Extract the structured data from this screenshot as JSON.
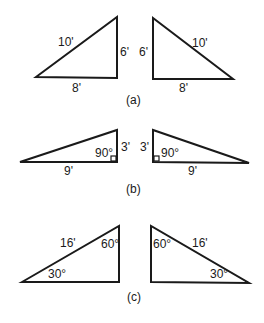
{
  "figure": {
    "panels": [
      {
        "caption": "(a)",
        "left": {
          "hyp": "10'",
          "vert": "6'",
          "base": "8'"
        },
        "right": {
          "hyp": "10'",
          "vert": "6'",
          "base": "8'"
        }
      },
      {
        "caption": "(b)",
        "left": {
          "angle": "90°",
          "vert": "3'",
          "base": "9'"
        },
        "right": {
          "angle": "90°",
          "vert": "3'",
          "base": "9'"
        }
      },
      {
        "caption": "(c)",
        "left": {
          "hyp": "16'",
          "top_angle": "60°",
          "bottom_angle": "30°"
        },
        "right": {
          "hyp": "16'",
          "top_angle": "60°",
          "bottom_angle": "30°"
        }
      }
    ]
  }
}
